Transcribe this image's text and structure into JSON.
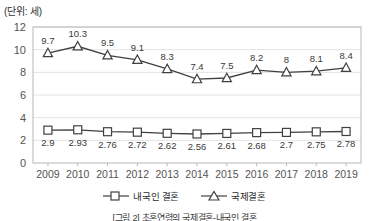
{
  "unit_label": "(단위: 세)",
  "caption": "[그림 2] 초혼연령의 국제결혼-내국인 결혼",
  "legend": {
    "position": "bottom-center",
    "items": [
      {
        "label": "내국인 결혼",
        "marker": "square-marker-icon",
        "color": "#404040"
      },
      {
        "label": "국제결혼",
        "marker": "triangle-marker-icon",
        "color": "#404040"
      }
    ]
  },
  "chart_data": {
    "type": "line",
    "title": "",
    "subtitle": "",
    "xlabel": "",
    "ylabel": "(단위: 세)",
    "grid": true,
    "legend_position": "bottom",
    "categories": [
      "2009",
      "2010",
      "2011",
      "2012",
      "2013",
      "2014",
      "2015",
      "2016",
      "2017",
      "2018",
      "2019"
    ],
    "ylim": [
      0,
      12
    ],
    "yticks": [
      0,
      2,
      4,
      6,
      8,
      10,
      12
    ],
    "series": [
      {
        "name": "국제결혼",
        "marker": "triangle",
        "color": "#404040",
        "values": [
          9.7,
          10.3,
          9.5,
          9.1,
          8.3,
          7.4,
          7.5,
          8.2,
          8,
          8.1,
          8.4
        ],
        "labels": [
          "9.7",
          "10.3",
          "9.5",
          "9.1",
          "8.3",
          "7.4",
          "7.5",
          "8.2",
          "8",
          "8.1",
          "8.4"
        ]
      },
      {
        "name": "내국인 결혼",
        "marker": "square",
        "color": "#404040",
        "values": [
          2.9,
          2.93,
          2.76,
          2.72,
          2.62,
          2.56,
          2.61,
          2.68,
          2.7,
          2.75,
          2.78
        ],
        "labels": [
          "2.9",
          "2.93",
          "2.76",
          "2.72",
          "2.62",
          "2.56",
          "2.61",
          "2.68",
          "2.7",
          "2.75",
          "2.78"
        ]
      }
    ]
  },
  "colors": {
    "line": "#404040",
    "grid": "#e3e3e3",
    "axis": "#b8b8b8",
    "text": "#555555"
  }
}
